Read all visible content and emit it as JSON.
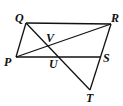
{
  "diagram": {
    "points": {
      "Q": {
        "label": "Q",
        "x": 26,
        "y": 23,
        "lx": 15,
        "ly": 22
      },
      "R": {
        "label": "R",
        "x": 111,
        "y": 24,
        "lx": 111,
        "ly": 22
      },
      "P": {
        "label": "P",
        "x": 16,
        "y": 57,
        "lx": 4,
        "ly": 66
      },
      "S": {
        "label": "S",
        "x": 101,
        "y": 57,
        "lx": 103,
        "ly": 62
      },
      "T": {
        "label": "T",
        "x": 90,
        "y": 90,
        "lx": 86,
        "ly": 102
      },
      "V": {
        "label": "V",
        "x": 49,
        "y": 47,
        "lx": 46,
        "ly": 42
      },
      "U": {
        "label": "U",
        "x": 55,
        "y": 57,
        "lx": 49,
        "ly": 68
      }
    },
    "segments": [
      {
        "name": "QR",
        "from": "Q",
        "to": "R"
      },
      {
        "name": "QP",
        "from": "Q",
        "to": "P"
      },
      {
        "name": "PS",
        "from": "P",
        "to": "S"
      },
      {
        "name": "PR",
        "from": "P",
        "to": "R"
      },
      {
        "name": "QT",
        "from": "Q",
        "to": "T"
      },
      {
        "name": "RT",
        "from": "R",
        "to": "T"
      }
    ]
  }
}
